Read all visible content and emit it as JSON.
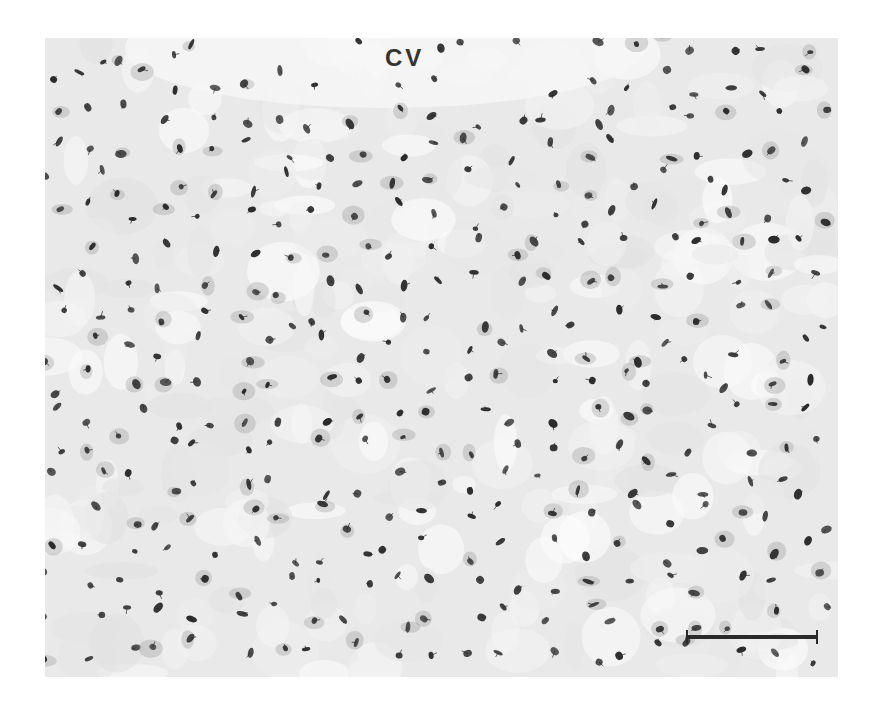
{
  "figure": {
    "type": "histology-micrograph",
    "label": "CV",
    "scale_bar": {
      "visible": true
    },
    "background_color": "#e9e9e9",
    "nucleus_color": "#2b2b2b",
    "nucleus_count_approx": 380
  }
}
